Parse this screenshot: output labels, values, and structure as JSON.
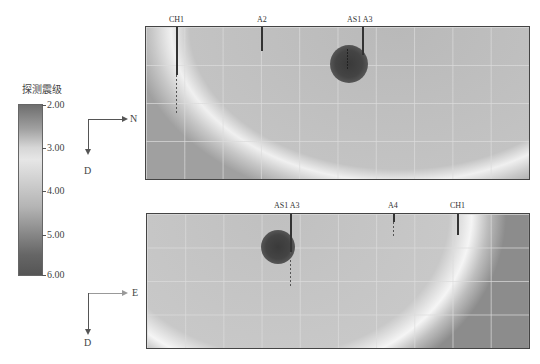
{
  "legend": {
    "title": "探测震级",
    "ticks": [
      "2.00",
      "3.00",
      "4.00",
      "5.00",
      "6.00"
    ],
    "range": [
      2.0,
      6.0
    ],
    "colormap": "grayscale (dark at 2.00 and 6.00, light near 3.00)"
  },
  "panels": [
    {
      "name": "N-D section",
      "axes": {
        "horizontal": "N",
        "vertical": "D"
      },
      "boreholes": [
        {
          "label": "CH1"
        },
        {
          "label": "A2"
        },
        {
          "label": "AS1  A3"
        }
      ],
      "anomalies": [
        {
          "description": "dark circular high-magnitude zone near AS1/A3"
        }
      ]
    },
    {
      "name": "E-D section",
      "axes": {
        "horizontal": "E",
        "vertical": "D"
      },
      "boreholes": [
        {
          "label": "AS1  A3"
        },
        {
          "label": "A4"
        },
        {
          "label": "CH1"
        }
      ],
      "anomalies": [
        {
          "description": "dark circular high-magnitude zone near AS1/A3"
        }
      ]
    }
  ]
}
